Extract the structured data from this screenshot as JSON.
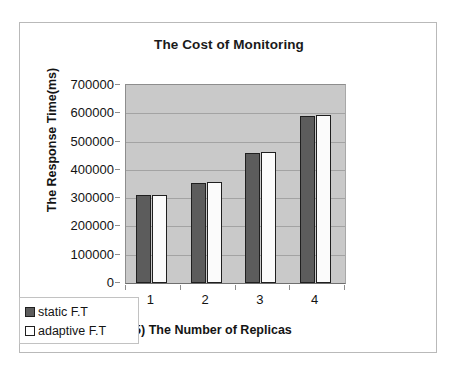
{
  "chart_data": {
    "type": "bar",
    "title": "The Cost of Monitoring",
    "xlabel": "(x5) The Number of Replicas",
    "ylabel": "The Response Time(ms)",
    "categories": [
      "1",
      "2",
      "3",
      "4"
    ],
    "series": [
      {
        "name": "static F.T",
        "values": [
          310000,
          353000,
          460000,
          592000
        ],
        "color": "#5c5c5c"
      },
      {
        "name": "adaptive F.T",
        "values": [
          311000,
          356000,
          464000,
          595000
        ],
        "color": "#fbfbfb"
      }
    ],
    "ylim": [
      0,
      700000
    ],
    "ytick_labels": [
      "700000",
      "600000",
      "500000",
      "400000",
      "300000",
      "200000",
      "100000",
      "0"
    ],
    "ytick_values": [
      700000,
      600000,
      500000,
      400000,
      300000,
      200000,
      100000,
      0
    ],
    "grid": true,
    "legend_position": "bottom-left",
    "plot_background": "#c9c9c9"
  },
  "legend": {
    "items": [
      {
        "label": "static F.T",
        "swatch": "dark-gray-square-icon"
      },
      {
        "label": "adaptive F.T",
        "swatch": "white-square-icon"
      }
    ]
  }
}
